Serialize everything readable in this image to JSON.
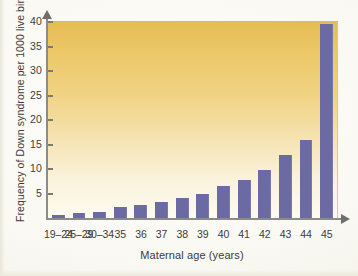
{
  "figure": {
    "bar_color": "#6b6aa3",
    "plot_gradient_top": "#e5bd54",
    "plot_gradient_bottom": "#fdfbf0",
    "axis_color": "#8b8b8b",
    "paper_color": "#fbfaf5"
  },
  "chart_data": {
    "type": "bar",
    "title": "",
    "xlabel": "Maternal age (years)",
    "ylabel": "Frequency of Down syndrome per 1000 live births",
    "categories": [
      "19–24",
      "25–29",
      "30–34",
      "35",
      "36",
      "37",
      "38",
      "39",
      "40",
      "41",
      "42",
      "43",
      "44",
      "45"
    ],
    "values": [
      0.7,
      1.0,
      1.3,
      2.2,
      2.6,
      3.2,
      4.0,
      4.8,
      6.5,
      7.8,
      9.8,
      12.9,
      16.0,
      39.5
    ],
    "ylim": [
      0,
      40
    ],
    "ytick_labels": [
      "5",
      "10",
      "15",
      "20",
      "25",
      "30",
      "35",
      "40"
    ],
    "ytick_values": [
      5,
      10,
      15,
      20,
      25,
      30,
      35,
      40
    ],
    "grid": false,
    "legend": null
  }
}
